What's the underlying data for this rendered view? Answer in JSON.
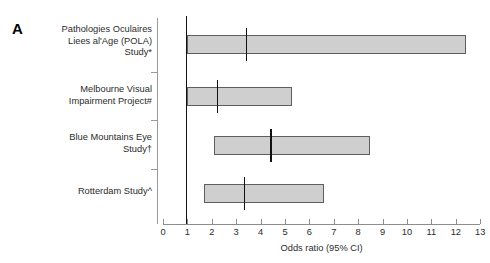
{
  "panel": {
    "letter": "A"
  },
  "chart_data": {
    "type": "bar",
    "title": "",
    "subtitle": "",
    "xlabel": "Odds ratio (95% CI)",
    "ylabel": "",
    "xlim": [
      0,
      13
    ],
    "xticks": [
      0,
      1,
      2,
      3,
      4,
      5,
      6,
      7,
      8,
      9,
      10,
      11,
      12,
      13
    ],
    "xticklabels": [
      "0",
      "1",
      "2",
      "3",
      "4",
      "5",
      "6",
      "7",
      "8",
      "9",
      "10",
      "11",
      "12",
      "13"
    ],
    "grid": false,
    "legend": "none",
    "reference_line": 1,
    "categories": [
      "Pathologies Oculaires Liees al'Age (POLA) Study*",
      "Melbourne Visual Impairment Project#",
      "Blue Mountains Eye Study†",
      "Rotterdam Study^"
    ],
    "series": [
      {
        "name": "Odds ratio (95% CI)",
        "points": [
          {
            "study": "Pathologies Oculaires Liees al'Age (POLA) Study*",
            "odds_ratio": 3.4,
            "ci_low": 1.0,
            "ci_high": 12.4
          },
          {
            "study": "Melbourne Visual Impairment Project#",
            "odds_ratio": 2.2,
            "ci_low": 1.0,
            "ci_high": 5.3
          },
          {
            "study": "Blue Mountains Eye Study†",
            "odds_ratio": 4.4,
            "ci_low": 2.1,
            "ci_high": 8.5
          },
          {
            "study": "Rotterdam Study^",
            "odds_ratio": 3.3,
            "ci_low": 1.7,
            "ci_high": 6.6
          }
        ]
      }
    ]
  },
  "studies": [
    {
      "label": "Pathologies Oculaires\nLiees al'Age (POLA)\nStudy*",
      "odds_ratio": 3.4,
      "ci_low": 1.0,
      "ci_high": 12.4
    },
    {
      "label": "Melbourne Visual\nImpairment Project#",
      "odds_ratio": 2.2,
      "ci_low": 1.0,
      "ci_high": 5.3
    },
    {
      "label": "Blue Mountains Eye\nStudy†",
      "odds_ratio": 4.4,
      "ci_low": 2.1,
      "ci_high": 8.5
    },
    {
      "label": "Rotterdam Study^",
      "odds_ratio": 3.3,
      "ci_low": 1.7,
      "ci_high": 6.6
    }
  ],
  "axis": {
    "title": "Odds ratio (95% CI)",
    "ticks": [
      "0",
      "1",
      "2",
      "3",
      "4",
      "5",
      "6",
      "7",
      "8",
      "9",
      "10",
      "11",
      "12",
      "13"
    ]
  },
  "colors": {
    "box_fill": "#cfcfcf",
    "box_border": "#5e5e5e",
    "marker": "#111111",
    "axis": "#8d8d8d",
    "text": "#2b2b2b"
  }
}
